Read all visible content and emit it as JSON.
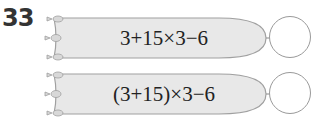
{
  "problem_number": "33",
  "rows": [
    {
      "expression": "3+15×3−6",
      "answer": ""
    },
    {
      "expression": "(3+15)×3−6",
      "answer": ""
    }
  ],
  "colors": {
    "shape_fill": "#e8e8e8",
    "shape_stroke": "#a0a0a0",
    "circle_stroke": "#9a9a9a",
    "text": "#222222"
  }
}
